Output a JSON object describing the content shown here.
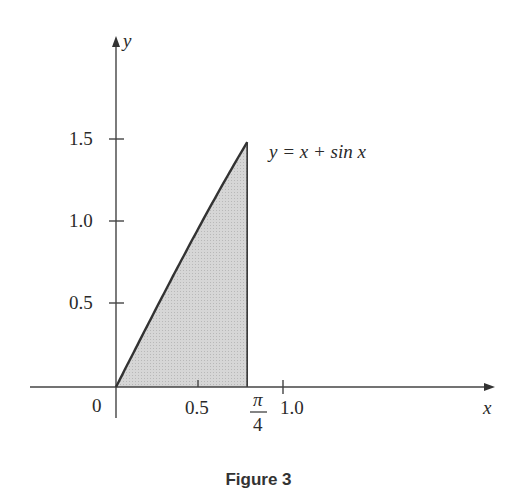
{
  "caption": "Figure 3",
  "chart_data": {
    "type": "area",
    "title": "",
    "caption": "Figure 3",
    "function": "y = x + sin x",
    "curve_label": "y = x + sin x",
    "xlabel": "x",
    "ylabel": "y",
    "origin_label": "0",
    "x_ticks": [
      {
        "value": 0.5,
        "label": "0.5"
      },
      {
        "value": 0.785398,
        "label": "π/4"
      },
      {
        "value": 1.0,
        "label": "1.0"
      }
    ],
    "y_ticks": [
      {
        "value": 0.5,
        "label": "0.5"
      },
      {
        "value": 1.0,
        "label": "1.0"
      },
      {
        "value": 1.5,
        "label": "1.5"
      }
    ],
    "shaded_region": {
      "x_from": 0,
      "x_to": 0.785398,
      "description": "area under y = x + sin x from 0 to π/4"
    },
    "x": [
      0,
      0.1,
      0.2,
      0.3,
      0.4,
      0.5,
      0.6,
      0.7,
      0.785398
    ],
    "y": [
      0,
      0.1998,
      0.3987,
      0.5955,
      0.7894,
      0.9794,
      1.1646,
      1.3442,
      1.4925
    ],
    "xlim": [
      -0.5,
      2.3
    ],
    "ylim": [
      -0.2,
      2.1
    ],
    "grid": false,
    "legend": "none"
  },
  "labels": {
    "x_axis": "x",
    "y_axis": "y",
    "origin": "0",
    "x_tick_05": "0.5",
    "x_tick_pi_num": "π",
    "x_tick_pi_den": "4",
    "x_tick_10": "1.0",
    "y_tick_05": "0.5",
    "y_tick_10": "1.0",
    "y_tick_15": "1.5",
    "curve": "y = x + sin x"
  }
}
